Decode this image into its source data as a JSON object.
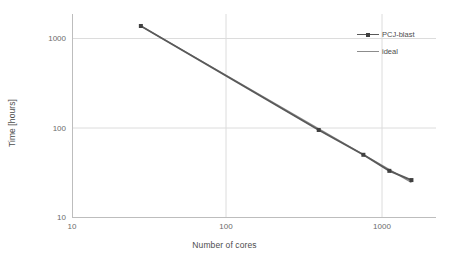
{
  "chart_data": {
    "type": "line",
    "title": "",
    "xlabel": "Number of cores",
    "ylabel": "Time [hours]",
    "xscale": "log",
    "yscale": "log",
    "xlim": [
      10,
      2000
    ],
    "ylim": [
      10,
      2000
    ],
    "xticks": [
      10,
      100,
      1000
    ],
    "xticklabels": [
      "10",
      "100",
      "1000"
    ],
    "yticks": [
      10,
      100,
      1000
    ],
    "yticklabels": [
      "10",
      "100",
      "1000"
    ],
    "grid": true,
    "legend_position": "upper right",
    "series": [
      {
        "name": "PCJ-blast",
        "color": "#595959",
        "marker": "square",
        "x": [
          28,
          400,
          780,
          1150,
          1600
        ],
        "y": [
          1400,
          95,
          50,
          33,
          26
        ]
      },
      {
        "name": "ideal",
        "color": "#8c8c8c",
        "marker": "none",
        "x": [
          28,
          1600
        ],
        "y": [
          1400,
          24.5
        ]
      }
    ]
  },
  "axes": {
    "x_title": "Number of cores",
    "y_title": "Time [hours]",
    "x_ticks": [
      "10",
      "100",
      "1000"
    ],
    "y_ticks": [
      "1000",
      "100",
      "10"
    ]
  },
  "legend": {
    "items": [
      {
        "label": "PCJ-blast"
      },
      {
        "label": "ideal"
      }
    ]
  },
  "colors": {
    "series_primary": "#595959",
    "series_ideal": "#8c8c8c",
    "grid": "#d9d9d9",
    "axis": "#bfbfbf",
    "text": "#595959",
    "background": "#ffffff"
  }
}
